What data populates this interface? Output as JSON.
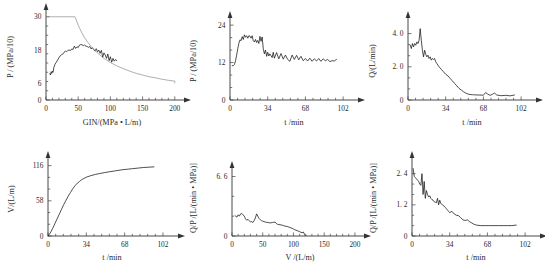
{
  "figure": {
    "panel_count": 6,
    "layout": "2 rows x 3 columns",
    "line_color": "#141414",
    "envelope_color": "#8d8d8d"
  },
  "chart_data": [
    {
      "id": "panel-1",
      "type": "line",
      "title": "",
      "xlabel": "GIN/(MPa • L/m)",
      "ylabel": "P / (MPa/10)",
      "xlim": [
        0,
        205
      ],
      "ylim": [
        0,
        31
      ],
      "xticks": [
        0,
        50,
        100,
        150,
        200
      ],
      "xtick_labels": [
        "0",
        "50",
        "100",
        "150",
        "200"
      ],
      "yticks": [
        0,
        6,
        18,
        30
      ],
      "ytick_labels": [
        "0",
        "6",
        "18",
        "30"
      ],
      "grid": false,
      "legend": "none",
      "series": [
        {
          "name": "grouting-pressure-path",
          "x": [
            6,
            7,
            8,
            9,
            10,
            11,
            12,
            13,
            14,
            16,
            18,
            20,
            22,
            24,
            26,
            28,
            30,
            32,
            34,
            36,
            38,
            40,
            42,
            44,
            46,
            48,
            50,
            52,
            54,
            56,
            58,
            60,
            62,
            64,
            66,
            68,
            70,
            72,
            74,
            76,
            78,
            80,
            82,
            84,
            86,
            88,
            90,
            92,
            94,
            96,
            98,
            100,
            102,
            104,
            106,
            108,
            110
          ],
          "y": [
            9.5,
            9.0,
            10.2,
            9.6,
            10.4,
            10.0,
            11.6,
            12.2,
            12.9,
            13.6,
            14.4,
            15.2,
            15.9,
            16.3,
            16.5,
            17.2,
            17.6,
            17.4,
            17.9,
            18.0,
            17.8,
            18.4,
            18.2,
            19.4,
            18.6,
            19.2,
            18.9,
            19.8,
            20.0,
            19.9,
            19.6,
            19.8,
            19.4,
            19.3,
            19.0,
            19.3,
            18.4,
            18.9,
            18.2,
            17.6,
            18.5,
            17.4,
            18.0,
            16.8,
            17.9,
            15.4,
            17.0,
            16.2,
            15.0,
            16.6,
            14.2,
            15.6,
            13.6,
            15.0,
            14.0,
            14.6,
            14.2
          ]
        },
        {
          "name": "gin-envelope-hyperbola",
          "x": [
            45,
            50,
            55,
            60,
            65,
            70,
            80,
            90,
            100,
            110,
            120,
            130,
            140,
            150,
            160,
            170,
            180,
            190,
            200
          ],
          "y": [
            30.0,
            27.0,
            24.5,
            22.4,
            20.8,
            19.3,
            16.9,
            15.0,
            13.5,
            12.3,
            11.3,
            10.4,
            9.6,
            9.0,
            8.4,
            8.0,
            7.5,
            7.1,
            6.8
          ]
        }
      ]
    },
    {
      "id": "panel-2",
      "type": "line",
      "title": "",
      "xlabel": "t /min",
      "ylabel": "P / (MPa/10)",
      "xlim": [
        0,
        110
      ],
      "ylim": [
        0,
        25
      ],
      "xticks": [
        0,
        34,
        68,
        102
      ],
      "xtick_labels": [
        "0",
        "34",
        "68",
        "102"
      ],
      "yticks": [
        0,
        12,
        24
      ],
      "ytick_labels": [
        "0",
        "12",
        "24"
      ],
      "grid": false,
      "legend": "none",
      "series": [
        {
          "name": "pressure-vs-time",
          "x": [
            2,
            3,
            4,
            5,
            6,
            7,
            8,
            9,
            10,
            11,
            12,
            13,
            14,
            15,
            16,
            17,
            18,
            19,
            20,
            21,
            22,
            23,
            24,
            25,
            26,
            27,
            28,
            29,
            30,
            31,
            32,
            33,
            34,
            35,
            36,
            37,
            38,
            39,
            40,
            42,
            44,
            46,
            48,
            50,
            52,
            54,
            56,
            58,
            60,
            62,
            64,
            66,
            68,
            70,
            72,
            74,
            76,
            78,
            80,
            82,
            84,
            86,
            88,
            90,
            92,
            94,
            96
          ],
          "y": [
            11.0,
            11.0,
            11.4,
            12.6,
            14.4,
            16.4,
            18.2,
            19.3,
            19.0,
            20.3,
            19.4,
            20.9,
            20.1,
            20.6,
            19.8,
            20.6,
            20.5,
            19.8,
            20.6,
            19.0,
            18.6,
            19.4,
            18.4,
            19.1,
            18.1,
            20.4,
            18.8,
            20.2,
            16.4,
            14.8,
            16.0,
            14.0,
            15.3,
            14.1,
            14.8,
            14.2,
            13.6,
            15.3,
            13.4,
            15.2,
            13.2,
            14.9,
            13.1,
            14.4,
            13.0,
            12.4,
            14.4,
            13.0,
            14.3,
            12.9,
            14.0,
            12.6,
            13.3,
            12.5,
            13.4,
            12.4,
            13.2,
            12.5,
            13.3,
            12.4,
            13.2,
            12.6,
            13.0,
            12.3,
            12.6,
            12.5,
            13.0
          ]
        }
      ]
    },
    {
      "id": "panel-3",
      "type": "line",
      "title": "",
      "xlabel": "t /min",
      "ylabel": "Q/(L/min)",
      "xlim": [
        0,
        110
      ],
      "ylim": [
        0,
        4.7
      ],
      "xticks": [
        0,
        34,
        68,
        102
      ],
      "xtick_labels": [
        "0",
        "34",
        "68",
        "102"
      ],
      "yticks": [
        0,
        2.0,
        4.0
      ],
      "ytick_labels": [
        "0",
        "2. 0",
        "4. 0"
      ],
      "grid": false,
      "legend": "none",
      "series": [
        {
          "name": "flow-rate-vs-time",
          "x": [
            2,
            3,
            4,
            5,
            6,
            7,
            8,
            9,
            10,
            11,
            12,
            13,
            14,
            15,
            16,
            17,
            18,
            19,
            20,
            21,
            22,
            23,
            24,
            25,
            26,
            27,
            28,
            30,
            32,
            34,
            36,
            38,
            40,
            42,
            44,
            46,
            48,
            50,
            52,
            54,
            56,
            58,
            60,
            64,
            68,
            70,
            72,
            74,
            76,
            78,
            80,
            84,
            88,
            92,
            96
          ],
          "y": [
            3.3,
            3.1,
            3.4,
            3.2,
            3.4,
            3.3,
            3.5,
            3.4,
            3.6,
            4.3,
            3.6,
            3.0,
            2.6,
            3.0,
            2.75,
            2.6,
            2.7,
            2.5,
            2.6,
            2.4,
            2.5,
            2.45,
            2.5,
            2.3,
            2.2,
            2.1,
            2.0,
            1.85,
            1.7,
            1.55,
            1.45,
            1.3,
            1.15,
            1.0,
            0.85,
            0.7,
            0.6,
            0.5,
            0.42,
            0.36,
            0.33,
            0.32,
            0.31,
            0.3,
            0.29,
            0.45,
            0.35,
            0.28,
            0.34,
            0.42,
            0.3,
            0.26,
            0.28,
            0.25,
            0.3
          ]
        }
      ]
    },
    {
      "id": "panel-4",
      "type": "line",
      "title": "",
      "xlabel": "t /min",
      "ylabel": "V/(L/m)",
      "xlim": [
        0,
        110
      ],
      "ylim": [
        0,
        122
      ],
      "xticks": [
        0,
        34,
        68,
        102
      ],
      "xtick_labels": [
        "0",
        "34",
        "68",
        "102"
      ],
      "yticks": [
        0,
        58,
        116
      ],
      "ytick_labels": [
        "0",
        "58",
        "116"
      ],
      "grid": false,
      "legend": "none",
      "series": [
        {
          "name": "cumulative-volume-vs-time",
          "x": [
            0,
            2,
            4,
            6,
            8,
            10,
            12,
            14,
            16,
            18,
            20,
            22,
            24,
            26,
            28,
            30,
            32,
            34,
            38,
            42,
            46,
            50,
            55,
            60,
            65,
            70,
            75,
            80,
            85,
            90,
            94
          ],
          "y": [
            0,
            5,
            12,
            20,
            28,
            36,
            44,
            52,
            59,
            66,
            72,
            78,
            83,
            87,
            90,
            93,
            95,
            97,
            99.5,
            101.5,
            103,
            104.5,
            106,
            107.5,
            109,
            110,
            111,
            112,
            113,
            113.5,
            114
          ]
        }
      ]
    },
    {
      "id": "panel-5",
      "type": "line",
      "title": "",
      "xlabel": "V /(L/m)",
      "ylabel": "Q/P /[L/(min • MPa)]",
      "xlim": [
        0,
        205
      ],
      "ylim": [
        0,
        7.1
      ],
      "xticks": [
        0,
        50,
        100,
        150,
        200
      ],
      "xtick_labels": [
        "0",
        "50",
        "100",
        "150",
        "200"
      ],
      "yticks": [
        0,
        6.6
      ],
      "ytick_labels": [
        "0",
        "6. 6"
      ],
      "grid": false,
      "legend": "none",
      "series": [
        {
          "name": "apparent-lugeon-vs-volume",
          "x": [
            5,
            8,
            10,
            12,
            14,
            16,
            18,
            20,
            22,
            24,
            26,
            28,
            30,
            32,
            34,
            36,
            38,
            40,
            42,
            44,
            46,
            48,
            50,
            54,
            58,
            62,
            66,
            70,
            72,
            74,
            78,
            82,
            86,
            90,
            94,
            98,
            102,
            106,
            110,
            114,
            116,
            118,
            119
          ],
          "y": [
            2.25,
            2.1,
            2.35,
            2.2,
            2.45,
            2.5,
            2.35,
            2.2,
            1.9,
            1.75,
            1.85,
            1.7,
            1.55,
            1.6,
            1.5,
            1.7,
            2.0,
            2.45,
            2.2,
            1.95,
            1.8,
            1.7,
            1.65,
            1.55,
            1.5,
            1.45,
            1.5,
            1.55,
            1.4,
            1.3,
            1.25,
            1.2,
            1.1,
            1.05,
            0.95,
            0.85,
            0.7,
            0.6,
            0.48,
            0.35,
            0.45,
            0.2,
            0.05
          ]
        }
      ]
    },
    {
      "id": "panel-6",
      "type": "line",
      "title": "",
      "xlabel": "t /min",
      "ylabel": "Q/P /[L/(min • MPa)]",
      "xlim": [
        0,
        110
      ],
      "ylim": [
        0,
        2.85
      ],
      "xticks": [
        0,
        34,
        68,
        102
      ],
      "xtick_labels": [
        "0",
        "34",
        "68",
        "102"
      ],
      "yticks": [
        0,
        1.2,
        2.4
      ],
      "ytick_labels": [
        "0",
        "1. 2",
        "2. 4"
      ],
      "grid": false,
      "legend": "none",
      "series": [
        {
          "name": "apparent-lugeon-vs-time",
          "x": [
            1,
            2,
            3,
            4,
            5,
            6,
            7,
            8,
            9,
            10,
            11,
            12,
            13,
            14,
            15,
            16,
            17,
            18,
            19,
            20,
            21,
            22,
            23,
            24,
            25,
            26,
            27,
            28,
            29,
            30,
            31,
            32,
            33,
            34,
            36,
            38,
            40,
            42,
            44,
            46,
            48,
            50,
            52,
            54,
            56,
            58,
            62,
            66,
            70,
            74,
            78,
            82,
            86,
            90,
            94
          ],
          "y": [
            2.6,
            2.3,
            2.25,
            2.2,
            2.15,
            2.1,
            2.0,
            1.95,
            2.4,
            1.6,
            2.1,
            1.45,
            1.75,
            1.6,
            1.5,
            1.55,
            1.45,
            1.4,
            1.38,
            1.32,
            1.3,
            1.28,
            1.45,
            1.2,
            1.38,
            1.25,
            1.22,
            1.18,
            1.15,
            1.1,
            1.05,
            1.0,
            0.95,
            0.9,
            0.95,
            0.85,
            0.8,
            0.78,
            0.7,
            0.62,
            0.6,
            0.62,
            0.55,
            0.5,
            0.45,
            0.42,
            0.4,
            0.4,
            0.4,
            0.4,
            0.4,
            0.4,
            0.4,
            0.4,
            0.42
          ]
        }
      ]
    }
  ]
}
